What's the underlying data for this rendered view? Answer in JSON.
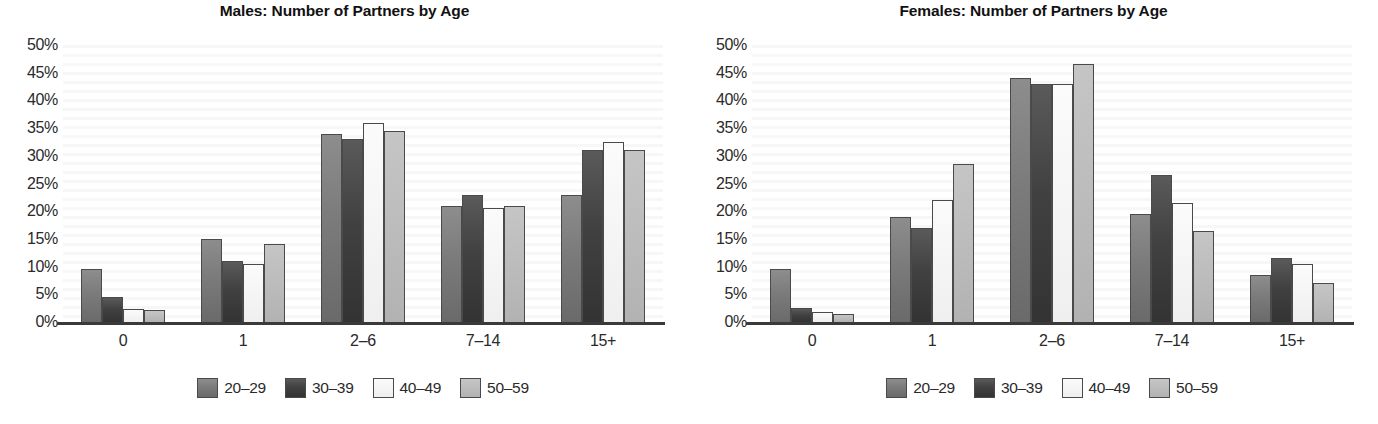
{
  "chart_data": [
    {
      "type": "bar",
      "title": "Males: Number of Partners by Age",
      "xlabel": "",
      "ylabel": "",
      "ylim": [
        0,
        50
      ],
      "ytick_labels": [
        "50%",
        "45%",
        "40%",
        "35%",
        "30%",
        "25%",
        "20%",
        "15%",
        "10%",
        "5%",
        "0%"
      ],
      "ytick_values": [
        50,
        45,
        40,
        35,
        30,
        25,
        20,
        15,
        10,
        5,
        0
      ],
      "grid": false,
      "legend_position": "bottom",
      "categories": [
        "0",
        "1",
        "2–6",
        "7–14",
        "15+"
      ],
      "series": [
        {
          "name": "20–29",
          "color": "#7b7b7b",
          "values": [
            9.5,
            15.0,
            34.0,
            21.0,
            23.0
          ]
        },
        {
          "name": "30–39",
          "color": "#414141",
          "values": [
            4.5,
            11.0,
            33.0,
            23.0,
            31.0
          ]
        },
        {
          "name": "40–49",
          "color": "#f5f5f5",
          "values": [
            2.3,
            10.5,
            36.0,
            20.5,
            32.5
          ]
        },
        {
          "name": "50–59",
          "color": "#bcbcbc",
          "values": [
            2.2,
            14.0,
            34.5,
            21.0,
            31.0
          ]
        }
      ]
    },
    {
      "type": "bar",
      "title": "Females: Number of Partners by Age",
      "xlabel": "",
      "ylabel": "",
      "ylim": [
        0,
        50
      ],
      "ytick_labels": [
        "50%",
        "45%",
        "40%",
        "35%",
        "30%",
        "25%",
        "20%",
        "15%",
        "10%",
        "5%",
        "0%"
      ],
      "ytick_values": [
        50,
        45,
        40,
        35,
        30,
        25,
        20,
        15,
        10,
        5,
        0
      ],
      "grid": false,
      "legend_position": "bottom",
      "categories": [
        "0",
        "1",
        "2–6",
        "7–14",
        "15+"
      ],
      "series": [
        {
          "name": "20–29",
          "color": "#7b7b7b",
          "values": [
            9.5,
            19.0,
            44.0,
            19.5,
            8.5
          ]
        },
        {
          "name": "30–39",
          "color": "#414141",
          "values": [
            2.5,
            17.0,
            43.0,
            26.5,
            11.5
          ]
        },
        {
          "name": "40–49",
          "color": "#f5f5f5",
          "values": [
            1.8,
            22.0,
            43.0,
            21.5,
            10.5
          ]
        },
        {
          "name": "50–59",
          "color": "#bcbcbc",
          "values": [
            1.5,
            28.5,
            46.5,
            16.5,
            7.0
          ]
        }
      ]
    }
  ]
}
